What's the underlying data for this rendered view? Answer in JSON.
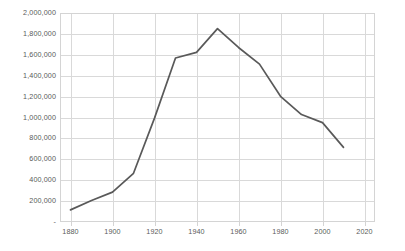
{
  "chart_data": {
    "type": "line",
    "title": "",
    "subtitle": "",
    "xlabel": "",
    "ylabel": "",
    "grid": true,
    "legend": false,
    "legend_position": "none",
    "series_color": "#595959",
    "x": [
      1880,
      1890,
      1900,
      1910,
      1920,
      1930,
      1940,
      1950,
      1960,
      1970,
      1980,
      1990,
      2000,
      2010
    ],
    "values": [
      116000,
      206000,
      286000,
      466000,
      994000,
      1569000,
      1623000,
      1850000,
      1670000,
      1511000,
      1203000,
      1028000,
      951000,
      714000
    ],
    "series": [
      {
        "name": "Population",
        "values": [
          116000,
          206000,
          286000,
          466000,
          994000,
          1569000,
          1623000,
          1850000,
          1670000,
          1511000,
          1203000,
          1028000,
          951000,
          714000
        ]
      }
    ],
    "xlim": [
      1875,
      2025
    ],
    "ylim": [
      0,
      2000000
    ],
    "ytick_values": [
      0,
      200000,
      400000,
      600000,
      800000,
      1000000,
      1200000,
      1400000,
      1600000,
      1800000,
      2000000
    ],
    "ytick_labels": [
      "-",
      "200,000",
      "400,000",
      "600,000",
      "800,000",
      "1,000,000",
      "1,200,000",
      "1,400,000",
      "1,600,000",
      "1,800,000",
      "2,000,000"
    ],
    "xtick_values": [
      1880,
      1900,
      1920,
      1940,
      1960,
      1980,
      2000,
      2020
    ],
    "xtick_labels": [
      "1880",
      "1900",
      "1920",
      "1940",
      "1960",
      "1980",
      "2000",
      "2020"
    ],
    "annotations": []
  },
  "axes": {
    "y_axis_name": "y-axis",
    "x_axis_name": "x-axis"
  }
}
